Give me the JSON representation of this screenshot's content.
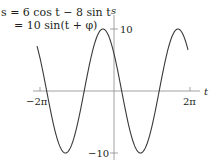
{
  "chart_data": {
    "type": "line",
    "title": "",
    "equation_line1": "s = 6 cos t − 8 sin t",
    "equation_line2": "= 10 sin(t + φ)",
    "xlabel": "t",
    "ylabel": "s",
    "x_ticks": [
      {
        "value": -6.2832,
        "label": "−2π"
      },
      {
        "value": 6.2832,
        "label": "2π"
      }
    ],
    "y_ticks": [
      {
        "value": 10,
        "label": "10"
      },
      {
        "value": -10,
        "label": "−10"
      }
    ],
    "xlim": [
      -6.5,
      6.9
    ],
    "ylim": [
      -10.5,
      10.5
    ],
    "grid": false,
    "series": [
      {
        "name": "s = 10 sin(t + φ)",
        "amplitude": 10,
        "phase_rad": 2.498,
        "t_range": [
          -6.45,
          6.2
        ],
        "formula": "6cos(t) - 8sin(t)",
        "sample_points": [
          {
            "t": -6.2832,
            "s": 6
          },
          {
            "t": -5.4248,
            "s": 10
          },
          {
            "t": -3.6396,
            "s": 0
          },
          {
            "t": -2.2832,
            "s": -10
          },
          {
            "t": -0.6435,
            "s": 0
          },
          {
            "t": 0,
            "s": 6
          },
          {
            "t": 0.6435,
            "s": 0
          },
          {
            "t": 2.2832,
            "s": -10
          },
          {
            "t": 3.7851,
            "s": 0
          },
          {
            "t": 5.4248,
            "s": 10
          },
          {
            "t": 6.2832,
            "s": 6
          }
        ]
      }
    ]
  },
  "labels": {
    "eq1": "s = 6 cos t − 8 sin t",
    "eq2": "= 10 sin(t + φ)",
    "axis_s": "s",
    "axis_t": "t",
    "tick_pos10": "10",
    "tick_neg10": "−10",
    "tick_neg2pi": "−2π",
    "tick_pos2pi": "2π"
  },
  "colors": {
    "curve": "#3a3a3a",
    "axis": "#7a7a7a",
    "text": "#231f20"
  }
}
